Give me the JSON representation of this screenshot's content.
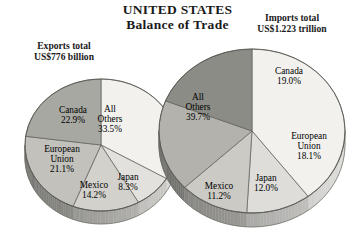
{
  "header": {
    "title_line1": "UNITED STATES",
    "title_line2": "Balance of Trade"
  },
  "exports_caption": {
    "line1": "Exports total",
    "line2": "US$776 billion"
  },
  "imports_caption": {
    "line1": "Imports total",
    "line2": "US$1.223 trillion"
  },
  "chart_data": [
    {
      "type": "pie",
      "title": "Exports total US$776 billion",
      "id": "exports",
      "total_label": "US$776 billion",
      "categories": [
        "All Others",
        "Japan",
        "Mexico",
        "European Union",
        "Canada"
      ],
      "values": [
        33.5,
        8.3,
        14.2,
        21.1,
        22.9
      ],
      "value_labels": [
        "33.5%",
        "8.3%",
        "14.2%",
        "21.1%",
        "22.9%"
      ],
      "colors": [
        "#f2f1ee",
        "#e2e1dd",
        "#d2d1cc",
        "#c2c1bb",
        "#a8a8a2"
      ],
      "legend": "none",
      "grid": false,
      "start_angle_deg": 0,
      "direction": "clockwise"
    },
    {
      "type": "pie",
      "title": "Imports total US$1.223 trillion",
      "id": "imports",
      "total_label": "US$1.223 trillion",
      "categories": [
        "All Others",
        "Mexico",
        "Japan",
        "European Union",
        "Canada"
      ],
      "values": [
        39.7,
        11.2,
        12.0,
        18.1,
        19.0
      ],
      "value_labels": [
        "39.7%",
        "11.2%",
        "12.0%",
        "18.1%",
        "19.0%"
      ],
      "colors": [
        "#f2f1ee",
        "#dedddA",
        "#cbcac5",
        "#b3b2ac",
        "#8c8c86"
      ],
      "legend": "none",
      "grid": false,
      "start_angle_deg": 0,
      "direction": "clockwise"
    }
  ],
  "exports_slices": {
    "all_others": {
      "name": "All",
      "name2": "Others",
      "pct": "33.5%"
    },
    "japan": {
      "name": "Japan",
      "pct": "8.3%"
    },
    "mexico": {
      "name": "Mexico",
      "pct": "14.2%"
    },
    "european_union": {
      "name": "European",
      "name2": "Union",
      "pct": "21.1%"
    },
    "canada": {
      "name": "Canada",
      "pct": "22.9%"
    }
  },
  "imports_slices": {
    "all_others": {
      "name": "All",
      "name2": "Others",
      "pct": "39.7%"
    },
    "mexico": {
      "name": "Mexico",
      "pct": "11.2%"
    },
    "japan": {
      "name": "Japan",
      "pct": "12.0%"
    },
    "european_union": {
      "name": "European",
      "name2": "Union",
      "pct": "18.1%"
    },
    "canada": {
      "name": "Canada",
      "pct": "19.0%"
    }
  }
}
